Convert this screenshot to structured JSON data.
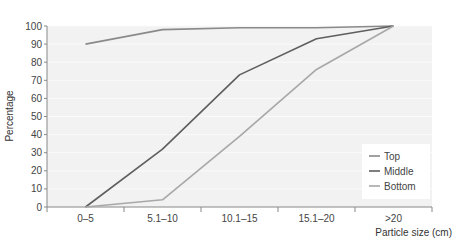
{
  "chart_data": {
    "type": "line",
    "title": "",
    "xlabel": "Particle size (cm)",
    "ylabel": "Percentage",
    "ylim": [
      0,
      100
    ],
    "yticks": [
      0,
      10,
      20,
      30,
      40,
      50,
      60,
      70,
      80,
      90,
      100
    ],
    "categories": [
      "0–5",
      "5.1–10",
      "10.1–15",
      "15.1–20",
      ">20"
    ],
    "grid": true,
    "legend_position": "lower right",
    "series": [
      {
        "name": "Top",
        "color": "#8a8a8a",
        "values": [
          90,
          98,
          99,
          99,
          100
        ]
      },
      {
        "name": "Middle",
        "color": "#5e5e5e",
        "values": [
          0,
          32,
          73,
          93,
          100
        ]
      },
      {
        "name": "Bottom",
        "color": "#a8a8a8",
        "values": [
          0,
          4,
          39,
          76,
          100
        ]
      }
    ]
  },
  "colors": {
    "plot_background": "#f2f2f2",
    "gridline": "#fafafa",
    "axis": "#888888",
    "legend_background": "#ffffff"
  }
}
